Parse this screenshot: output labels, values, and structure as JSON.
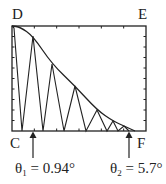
{
  "diagram": {
    "corner_labels": {
      "top_left": "D",
      "top_right": "E",
      "bottom_left": "C",
      "bottom_right": "F"
    },
    "annotations": [
      {
        "symbol": "θ",
        "subscript": "1",
        "equals": "= 0.94°",
        "arrow_x": 33
      },
      {
        "symbol": "θ",
        "subscript": "2",
        "equals": "= 5.7°",
        "arrow_x": 129
      }
    ],
    "colors": {
      "ink": "#222222",
      "background": "#ffffff"
    },
    "frame": {
      "left": 12,
      "top": 26,
      "right": 146,
      "bottom": 131
    },
    "envelope_points": [
      [
        12,
        26
      ],
      [
        20,
        27
      ],
      [
        33,
        36
      ],
      [
        52,
        64
      ],
      [
        75,
        86
      ],
      [
        97,
        110
      ],
      [
        113,
        121
      ],
      [
        124,
        126
      ],
      [
        135,
        131
      ]
    ],
    "oscillation_points": [
      [
        12,
        26
      ],
      [
        14,
        28
      ],
      [
        22,
        131
      ],
      [
        33,
        36
      ],
      [
        43,
        131
      ],
      [
        52,
        64
      ],
      [
        64,
        131
      ],
      [
        75,
        86
      ],
      [
        86,
        131
      ],
      [
        97,
        110
      ],
      [
        107,
        131
      ],
      [
        113,
        121
      ],
      [
        118,
        131
      ],
      [
        124,
        126
      ],
      [
        129,
        131
      ]
    ]
  }
}
